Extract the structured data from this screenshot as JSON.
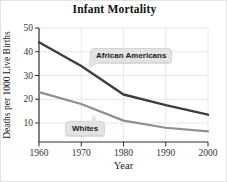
{
  "chart_data": {
    "type": "line",
    "title": "Infant Mortality",
    "xlabel": "Year",
    "ylabel": "Deaths per 1000 Live Births",
    "x": [
      1960,
      1970,
      1980,
      1990,
      2000
    ],
    "series": [
      {
        "name": "African Americans",
        "values": [
          44,
          34,
          22,
          17.5,
          13.5
        ],
        "color": "#3e3e3e",
        "width": 2.4
      },
      {
        "name": "Whites",
        "values": [
          23,
          18,
          11,
          8,
          6.5
        ],
        "color": "#8f8f8f",
        "width": 2.2
      }
    ],
    "xlim": [
      1960,
      2000
    ],
    "ylim": [
      0,
      50
    ],
    "xticks": [
      1960,
      1970,
      1980,
      1990,
      2000
    ],
    "yticks": [
      10,
      20,
      30,
      40,
      50
    ],
    "grid": true,
    "grid_color": "#f0e5e3",
    "axis_color": "#2e2e2e",
    "tick_label_color": "#333333",
    "legend_position": "inline-callouts"
  }
}
